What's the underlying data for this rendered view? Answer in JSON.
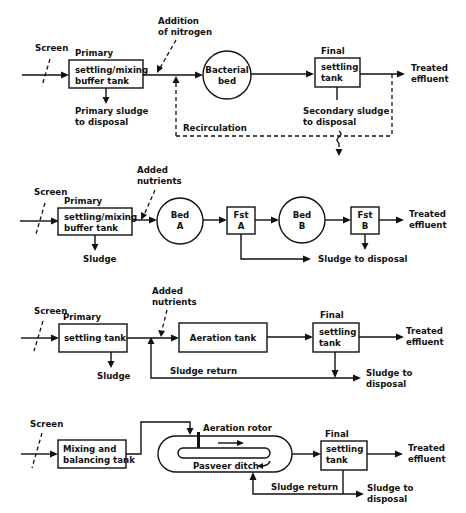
{
  "diagram": {
    "type": "process-flow",
    "panels": [
      {
        "id": "bacterial-bed",
        "screen_label": "Screen",
        "primary_label": "Primary",
        "primary_box": [
          "settling/mixing",
          "buffer tank"
        ],
        "addition_label": [
          "Addition",
          "of nitrogen"
        ],
        "primary_sludge": [
          "Primary sludge",
          "to disposal"
        ],
        "bed": [
          "Bacterial",
          "bed"
        ],
        "final_label": "Final",
        "final_box": [
          "settling",
          "tank"
        ],
        "secondary_sludge": [
          "Secondary sludge",
          "to disposal"
        ],
        "recirculation_label": "Recirculation",
        "output": [
          "Treated",
          "effluent"
        ]
      },
      {
        "id": "two-stage-beds",
        "screen_label": "Screen",
        "primary_label": "Primary",
        "primary_box": [
          "settling/mixing",
          "buffer tank"
        ],
        "addition_label": [
          "Added",
          "nutrients"
        ],
        "primary_sludge": "Sludge",
        "bed_a": [
          "Bed",
          "A"
        ],
        "fst_a": [
          "Fst",
          "A"
        ],
        "bed_b": [
          "Bed",
          "B"
        ],
        "fst_b": [
          "Fst",
          "B"
        ],
        "sludge_disposal": "Sludge to disposal",
        "output": [
          "Treated",
          "effluent"
        ]
      },
      {
        "id": "activated-sludge",
        "screen_label": "Screen",
        "primary_label": "Primary",
        "primary_box": "settling tank",
        "addition_label": [
          "Added",
          "nutrients"
        ],
        "primary_sludge": "Sludge",
        "aeration_box": "Aeration tank",
        "final_label": "Final",
        "final_box": [
          "settling",
          "tank"
        ],
        "sludge_return": "Sludge return",
        "sludge_disposal": [
          "Sludge to",
          "disposal"
        ],
        "output": [
          "Treated",
          "effluent"
        ]
      },
      {
        "id": "pasveer-ditch",
        "screen_label": "Screen",
        "mixing_box": [
          "Mixing and",
          "balancing tank"
        ],
        "rotor_label": "Aeration rotor",
        "ditch_label": "Pasveer ditch",
        "final_label": "Final",
        "final_box": [
          "settling",
          "tank"
        ],
        "sludge_return": "Sludge return",
        "sludge_disposal": [
          "Sludge to",
          "disposal"
        ],
        "output": [
          "Treated",
          "effluent"
        ]
      }
    ]
  }
}
